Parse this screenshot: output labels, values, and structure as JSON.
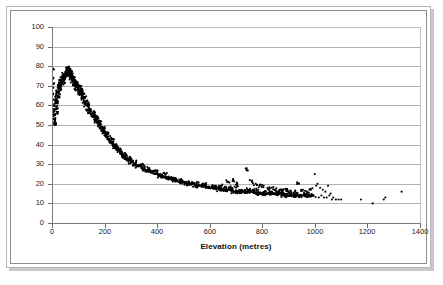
{
  "chart_data": {
    "type": "scatter",
    "title": "",
    "xlabel": "Elevation (metres)",
    "ylabel": "Percentage reduction in snowfall",
    "xlim": [
      0,
      1400
    ],
    "ylim": [
      0,
      100
    ],
    "xticks": [
      0,
      200,
      400,
      600,
      800,
      1000,
      1200,
      1400
    ],
    "yticks": [
      0,
      10,
      20,
      30,
      40,
      50,
      60,
      70,
      80,
      90,
      100
    ],
    "grid": "horizontal",
    "legend": "none",
    "marker": "filled-circle",
    "marker_color": "#000000",
    "points": [
      [
        2,
        79
      ],
      [
        2,
        74
      ],
      [
        3,
        71
      ],
      [
        3,
        69
      ],
      [
        4,
        66
      ],
      [
        5,
        63
      ],
      [
        6,
        60
      ],
      [
        6,
        57
      ],
      [
        7,
        55
      ],
      [
        8,
        53
      ],
      [
        9,
        51
      ],
      [
        10,
        50
      ],
      [
        11,
        52
      ],
      [
        12,
        55
      ],
      [
        13,
        58
      ],
      [
        14,
        61
      ],
      [
        15,
        63
      ],
      [
        16,
        59
      ],
      [
        17,
        56
      ],
      [
        18,
        62
      ],
      [
        19,
        65
      ],
      [
        20,
        67
      ],
      [
        21,
        64
      ],
      [
        22,
        61
      ],
      [
        24,
        66
      ],
      [
        25,
        68
      ],
      [
        26,
        70
      ],
      [
        27,
        67
      ],
      [
        28,
        64
      ],
      [
        30,
        69
      ],
      [
        31,
        71
      ],
      [
        32,
        73
      ],
      [
        33,
        70
      ],
      [
        34,
        68
      ],
      [
        36,
        72
      ],
      [
        37,
        74
      ],
      [
        38,
        71
      ],
      [
        40,
        73
      ],
      [
        41,
        75
      ],
      [
        42,
        72
      ],
      [
        44,
        74
      ],
      [
        45,
        76
      ],
      [
        46,
        73
      ],
      [
        48,
        75
      ],
      [
        50,
        77
      ],
      [
        51,
        74
      ],
      [
        52,
        76
      ],
      [
        54,
        78
      ],
      [
        55,
        75
      ],
      [
        56,
        77
      ],
      [
        58,
        79
      ],
      [
        59,
        76
      ],
      [
        60,
        78
      ],
      [
        62,
        79
      ],
      [
        63,
        77
      ],
      [
        64,
        78
      ],
      [
        65,
        76
      ],
      [
        66,
        79
      ],
      [
        68,
        77
      ],
      [
        69,
        75
      ],
      [
        70,
        78
      ],
      [
        71,
        76
      ],
      [
        72,
        74
      ],
      [
        73,
        77
      ],
      [
        74,
        75
      ],
      [
        75,
        73
      ],
      [
        76,
        76
      ],
      [
        78,
        74
      ],
      [
        79,
        72
      ],
      [
        80,
        75
      ],
      [
        82,
        73
      ],
      [
        83,
        71
      ],
      [
        84,
        74
      ],
      [
        85,
        72
      ],
      [
        86,
        70
      ],
      [
        88,
        73
      ],
      [
        89,
        71
      ],
      [
        90,
        69
      ],
      [
        92,
        72
      ],
      [
        94,
        70
      ],
      [
        95,
        68
      ],
      [
        96,
        71
      ],
      [
        98,
        69
      ],
      [
        100,
        67
      ],
      [
        102,
        70
      ],
      [
        104,
        68
      ],
      [
        105,
        66
      ],
      [
        108,
        69
      ],
      [
        110,
        67
      ],
      [
        112,
        65
      ],
      [
        114,
        68
      ],
      [
        116,
        66
      ],
      [
        118,
        64
      ],
      [
        120,
        66
      ],
      [
        122,
        64
      ],
      [
        124,
        62
      ],
      [
        126,
        64
      ],
      [
        128,
        62
      ],
      [
        130,
        60
      ],
      [
        132,
        62
      ],
      [
        135,
        60
      ],
      [
        137,
        58
      ],
      [
        140,
        60
      ],
      [
        142,
        58
      ],
      [
        145,
        56
      ],
      [
        148,
        58
      ],
      [
        150,
        57
      ],
      [
        152,
        55
      ],
      [
        155,
        56
      ],
      [
        158,
        54
      ],
      [
        160,
        55
      ],
      [
        163,
        53
      ],
      [
        165,
        54
      ],
      [
        168,
        52
      ],
      [
        170,
        53
      ],
      [
        173,
        51
      ],
      [
        175,
        52
      ],
      [
        178,
        50
      ],
      [
        180,
        51
      ],
      [
        183,
        50
      ],
      [
        185,
        49
      ],
      [
        188,
        48
      ],
      [
        190,
        49
      ],
      [
        193,
        47
      ],
      [
        195,
        48
      ],
      [
        198,
        46
      ],
      [
        200,
        47
      ],
      [
        203,
        46
      ],
      [
        205,
        45
      ],
      [
        208,
        45
      ],
      [
        210,
        44
      ],
      [
        213,
        44
      ],
      [
        215,
        43
      ],
      [
        218,
        43
      ],
      [
        220,
        42
      ],
      [
        223,
        42
      ],
      [
        225,
        41
      ],
      [
        228,
        41
      ],
      [
        230,
        41
      ],
      [
        233,
        40
      ],
      [
        235,
        40
      ],
      [
        238,
        39
      ],
      [
        240,
        39
      ],
      [
        243,
        39
      ],
      [
        245,
        38
      ],
      [
        248,
        38
      ],
      [
        250,
        38
      ],
      [
        253,
        37
      ],
      [
        255,
        37
      ],
      [
        258,
        36
      ],
      [
        260,
        36
      ],
      [
        263,
        36
      ],
      [
        265,
        35
      ],
      [
        268,
        35
      ],
      [
        270,
        35
      ],
      [
        273,
        34
      ],
      [
        275,
        34
      ],
      [
        278,
        34
      ],
      [
        280,
        33
      ],
      [
        283,
        33
      ],
      [
        285,
        33
      ],
      [
        288,
        33
      ],
      [
        290,
        32
      ],
      [
        293,
        32
      ],
      [
        295,
        32
      ],
      [
        298,
        32
      ],
      [
        300,
        31
      ],
      [
        305,
        31
      ],
      [
        310,
        30
      ],
      [
        315,
        30
      ],
      [
        320,
        30
      ],
      [
        325,
        29
      ],
      [
        330,
        29
      ],
      [
        335,
        29
      ],
      [
        340,
        28
      ],
      [
        345,
        28
      ],
      [
        350,
        28
      ],
      [
        355,
        27
      ],
      [
        360,
        27
      ],
      [
        365,
        27
      ],
      [
        370,
        26
      ],
      [
        375,
        26
      ],
      [
        380,
        26
      ],
      [
        385,
        26
      ],
      [
        390,
        25
      ],
      [
        395,
        25
      ],
      [
        400,
        25
      ],
      [
        405,
        25
      ],
      [
        410,
        24
      ],
      [
        415,
        24
      ],
      [
        420,
        24
      ],
      [
        425,
        24
      ],
      [
        430,
        23
      ],
      [
        435,
        23
      ],
      [
        440,
        23
      ],
      [
        445,
        23
      ],
      [
        450,
        23
      ],
      [
        455,
        22
      ],
      [
        460,
        22
      ],
      [
        465,
        22
      ],
      [
        470,
        22
      ],
      [
        475,
        22
      ],
      [
        480,
        21
      ],
      [
        485,
        21
      ],
      [
        490,
        21
      ],
      [
        495,
        21
      ],
      [
        500,
        21
      ],
      [
        505,
        21
      ],
      [
        510,
        20
      ],
      [
        515,
        20
      ],
      [
        520,
        20
      ],
      [
        525,
        20
      ],
      [
        530,
        20
      ],
      [
        535,
        20
      ],
      [
        540,
        20
      ],
      [
        545,
        19
      ],
      [
        550,
        19
      ],
      [
        555,
        19
      ],
      [
        560,
        19
      ],
      [
        565,
        19
      ],
      [
        570,
        19
      ],
      [
        575,
        19
      ],
      [
        580,
        19
      ],
      [
        585,
        18
      ],
      [
        590,
        18
      ],
      [
        595,
        18
      ],
      [
        600,
        18
      ],
      [
        605,
        18
      ],
      [
        610,
        18
      ],
      [
        615,
        18
      ],
      [
        620,
        18
      ],
      [
        625,
        18
      ],
      [
        630,
        18
      ],
      [
        635,
        17
      ],
      [
        640,
        17
      ],
      [
        645,
        17
      ],
      [
        650,
        17
      ],
      [
        655,
        17
      ],
      [
        660,
        17
      ],
      [
        665,
        17
      ],
      [
        670,
        17
      ],
      [
        675,
        17
      ],
      [
        680,
        17
      ],
      [
        685,
        17
      ],
      [
        690,
        16
      ],
      [
        695,
        16
      ],
      [
        700,
        16
      ],
      [
        705,
        16
      ],
      [
        710,
        16
      ],
      [
        715,
        16
      ],
      [
        720,
        16
      ],
      [
        725,
        16
      ],
      [
        730,
        16
      ],
      [
        735,
        16
      ],
      [
        740,
        16
      ],
      [
        745,
        16
      ],
      [
        750,
        16
      ],
      [
        755,
        16
      ],
      [
        760,
        16
      ],
      [
        765,
        16
      ],
      [
        770,
        16
      ],
      [
        775,
        15
      ],
      [
        780,
        15
      ],
      [
        785,
        15
      ],
      [
        790,
        15
      ],
      [
        795,
        15
      ],
      [
        800,
        15
      ],
      [
        805,
        15
      ],
      [
        810,
        15
      ],
      [
        815,
        15
      ],
      [
        820,
        15
      ],
      [
        825,
        15
      ],
      [
        830,
        15
      ],
      [
        835,
        15
      ],
      [
        840,
        15
      ],
      [
        845,
        15
      ],
      [
        850,
        15
      ],
      [
        855,
        15
      ],
      [
        860,
        15
      ],
      [
        865,
        15
      ],
      [
        870,
        15
      ],
      [
        875,
        15
      ],
      [
        880,
        14
      ],
      [
        885,
        14
      ],
      [
        890,
        14
      ],
      [
        895,
        14
      ],
      [
        900,
        14
      ],
      [
        905,
        14
      ],
      [
        910,
        14
      ],
      [
        915,
        14
      ],
      [
        920,
        14
      ],
      [
        925,
        14
      ],
      [
        930,
        14
      ],
      [
        935,
        14
      ],
      [
        940,
        14
      ],
      [
        945,
        14
      ],
      [
        950,
        14
      ],
      [
        955,
        14
      ],
      [
        960,
        14
      ],
      [
        965,
        14
      ],
      [
        970,
        14
      ],
      [
        975,
        14
      ],
      [
        980,
        14
      ],
      [
        985,
        14
      ],
      [
        990,
        14
      ],
      [
        995,
        14
      ],
      [
        670,
        21
      ],
      [
        690,
        22
      ],
      [
        705,
        20
      ],
      [
        740,
        27
      ],
      [
        760,
        21
      ],
      [
        775,
        20
      ],
      [
        790,
        19
      ],
      [
        805,
        19
      ],
      [
        820,
        18
      ],
      [
        835,
        18
      ],
      [
        850,
        17
      ],
      [
        865,
        17
      ],
      [
        880,
        17
      ],
      [
        895,
        17
      ],
      [
        910,
        16
      ],
      [
        925,
        16
      ],
      [
        940,
        20
      ],
      [
        955,
        17
      ],
      [
        970,
        16
      ],
      [
        985,
        17
      ],
      [
        1000,
        25
      ],
      [
        1005,
        19
      ],
      [
        1010,
        20
      ],
      [
        1015,
        13
      ],
      [
        1020,
        18
      ],
      [
        1025,
        14
      ],
      [
        1030,
        17
      ],
      [
        1035,
        13
      ],
      [
        1040,
        16
      ],
      [
        1045,
        13
      ],
      [
        1050,
        19
      ],
      [
        1055,
        14
      ],
      [
        1060,
        15
      ],
      [
        1065,
        12
      ],
      [
        1070,
        13
      ],
      [
        1080,
        12
      ],
      [
        1090,
        12
      ],
      [
        1100,
        12
      ],
      [
        1175,
        12
      ],
      [
        1220,
        10
      ],
      [
        1262,
        12
      ],
      [
        1268,
        13
      ],
      [
        1330,
        16
      ],
      [
        620,
        19
      ],
      [
        640,
        19
      ],
      [
        655,
        18
      ],
      [
        680,
        18
      ],
      [
        700,
        18
      ],
      [
        720,
        17
      ],
      [
        745,
        17
      ],
      [
        765,
        17
      ],
      [
        785,
        17
      ],
      [
        810,
        16
      ],
      [
        830,
        16
      ],
      [
        855,
        16
      ],
      [
        875,
        16
      ],
      [
        900,
        16
      ],
      [
        930,
        15
      ],
      [
        960,
        15
      ],
      [
        120,
        63
      ],
      [
        140,
        61
      ],
      [
        160,
        57
      ],
      [
        175,
        54
      ],
      [
        185,
        52
      ],
      [
        200,
        49
      ],
      [
        215,
        46
      ],
      [
        230,
        43
      ],
      [
        245,
        40
      ],
      [
        260,
        38
      ],
      [
        280,
        35
      ],
      [
        300,
        33
      ],
      [
        320,
        31
      ],
      [
        345,
        30
      ],
      [
        370,
        28
      ],
      [
        400,
        26
      ],
      [
        430,
        25
      ],
      [
        460,
        23
      ],
      [
        490,
        22
      ],
      [
        520,
        21
      ],
      [
        550,
        20
      ],
      [
        580,
        20
      ],
      [
        610,
        19
      ]
    ]
  },
  "figure": {
    "frame_color": "#8d8d8d",
    "grid_color": "#b0b0b0",
    "axis_color": "#7a7a7a",
    "point_color": "#000000",
    "background": "#ffffff"
  }
}
